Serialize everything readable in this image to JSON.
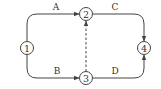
{
  "diagram": {
    "type": "network-activity-diagram",
    "nodes": [
      {
        "id": "1",
        "label": "1",
        "x": 27,
        "y": 48
      },
      {
        "id": "2",
        "label": "2",
        "x": 86,
        "y": 14
      },
      {
        "id": "3",
        "label": "3",
        "x": 86,
        "y": 78
      },
      {
        "id": "4",
        "label": "4",
        "x": 144,
        "y": 48
      }
    ],
    "edges": [
      {
        "from": "1",
        "to": "2",
        "label": "A",
        "style": "solid"
      },
      {
        "from": "1",
        "to": "3",
        "label": "B",
        "style": "solid"
      },
      {
        "from": "2",
        "to": "4",
        "label": "C",
        "style": "solid"
      },
      {
        "from": "3",
        "to": "4",
        "label": "D",
        "style": "solid"
      },
      {
        "from": "3",
        "to": "2",
        "label": "",
        "style": "dashed"
      }
    ],
    "colors": {
      "stroke": "#444444",
      "text": "#333333",
      "background": "#ffffff"
    }
  }
}
